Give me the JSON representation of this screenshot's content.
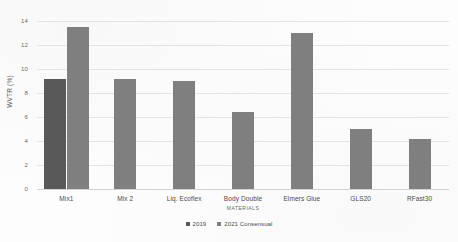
{
  "chart_data": {
    "type": "bar",
    "title": "",
    "xlabel": "MATERIALS",
    "ylabel": "WVTR (%)",
    "ylim": [
      0,
      14
    ],
    "ytick_step": 2,
    "yticks": [
      "0",
      "2",
      "4",
      "6",
      "8",
      "10",
      "12",
      "14"
    ],
    "grid": true,
    "legend_position": "bottom",
    "categories": [
      "Mix1",
      "Mix 2",
      "Liq. Ecoflex",
      "Body Double",
      "Elmers Glue",
      "GLS20",
      "RFast30"
    ],
    "series": [
      {
        "name": "2019",
        "color": "#595959",
        "values": [
          9.2,
          null,
          null,
          null,
          null,
          null,
          null
        ]
      },
      {
        "name": "2021 Consensual",
        "color": "#7f7f7f",
        "values": [
          13.5,
          9.2,
          9.0,
          6.4,
          13.0,
          5.0,
          4.2
        ]
      }
    ]
  },
  "legend": {
    "items": [
      {
        "label": "2019",
        "color": "#595959"
      },
      {
        "label": "2021 Consensual",
        "color": "#7f7f7f"
      }
    ]
  }
}
